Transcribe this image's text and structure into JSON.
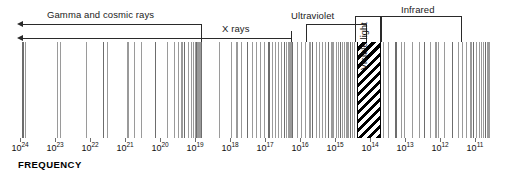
{
  "figure": {
    "axis_title": "FREQUENCY",
    "background_color": "#ffffff",
    "line_color": "#8e8e8e",
    "ink_color": "#2a2a2a"
  },
  "bands": {
    "gamma": {
      "label": "Gamma and cosmic rays",
      "marker": "arrow-left"
    },
    "xrays": {
      "label": "X rays",
      "marker": "arrow-left"
    },
    "ultraviolet": {
      "label": "Ultraviolet",
      "marker": "bracket"
    },
    "visible": {
      "label": "Visible light",
      "marker": "bracket",
      "orientation": "vertical",
      "fill": "diagonal-hatch"
    },
    "infrared": {
      "label": "Infrared",
      "marker": "bracket"
    }
  },
  "axis": {
    "label": "FREQUENCY",
    "unit_base": "10",
    "ticks": [
      {
        "base": "10",
        "exponent": "24"
      },
      {
        "base": "10",
        "exponent": "23"
      },
      {
        "base": "10",
        "exponent": "22"
      },
      {
        "base": "10",
        "exponent": "21"
      },
      {
        "base": "10",
        "exponent": "20"
      },
      {
        "base": "10",
        "exponent": "19"
      },
      {
        "base": "10",
        "exponent": "18"
      },
      {
        "base": "10",
        "exponent": "17"
      },
      {
        "base": "10",
        "exponent": "16"
      },
      {
        "base": "10",
        "exponent": "15"
      },
      {
        "base": "10",
        "exponent": "14"
      },
      {
        "base": "10",
        "exponent": "13"
      },
      {
        "base": "10",
        "exponent": "12"
      },
      {
        "base": "10",
        "exponent": "11"
      }
    ]
  },
  "chart_data": {
    "type": "line",
    "xlabel": "FREQUENCY",
    "ylabel": "",
    "x_scale": "log10-descending",
    "x_tick_exponents": [
      24,
      23,
      22,
      21,
      20,
      19,
      18,
      17,
      16,
      15,
      14,
      13,
      12,
      11
    ],
    "x_tick_labels": [
      "10^24",
      "10^23",
      "10^22",
      "10^21",
      "10^20",
      "10^19",
      "10^18",
      "10^17",
      "10^16",
      "10^15",
      "10^14",
      "10^13",
      "10^12",
      "10^11"
    ],
    "x_pixel_positions": [
      20,
      55,
      90,
      125,
      160,
      195,
      230,
      265,
      300,
      335,
      370,
      405,
      440,
      475
    ],
    "grid": false,
    "legend": false,
    "annotations": [
      {
        "text": "Gamma and cosmic rays",
        "type": "arrow-left",
        "x_start_px": 22,
        "x_end_px": 202,
        "y_px": 24
      },
      {
        "text": "X rays",
        "type": "arrow-left",
        "x_start_px": 22,
        "x_end_px": 292,
        "y_px": 38
      },
      {
        "text": "Ultraviolet",
        "type": "bracket",
        "x_start_px": 306,
        "x_end_px": 367,
        "y_px": 24
      },
      {
        "text": "Visible light",
        "type": "bracket-vertical",
        "x_start_px": 355,
        "x_end_px": 380,
        "y_px": 22
      },
      {
        "text": "Infrared",
        "type": "bracket",
        "x_start_px": 381,
        "x_end_px": 462,
        "y_px": 14
      }
    ],
    "visible_band": {
      "x_start_px": 357,
      "x_end_px": 381,
      "exponent_range": [
        15,
        14
      ]
    },
    "series": [
      {
        "name": "emission lines",
        "description": "vertical spectral emission lines across the frequency axis",
        "x_pixel_positions": [
          22,
          25,
          57,
          60,
          86,
          103,
          107,
          127,
          134,
          141,
          155,
          167,
          174,
          178,
          181,
          184,
          188,
          191,
          193,
          195,
          196,
          197,
          198,
          199,
          200,
          201,
          219,
          231,
          236,
          241,
          247,
          252,
          256,
          260,
          264,
          268,
          272,
          275,
          278,
          281,
          284,
          286,
          288,
          290,
          291,
          292,
          297,
          301,
          305,
          309,
          312,
          316,
          319,
          322,
          325,
          328,
          331,
          333,
          336,
          338,
          340,
          342,
          344,
          346,
          348,
          350,
          352,
          354,
          383,
          388,
          395,
          401,
          404,
          412,
          419,
          424,
          430,
          435,
          438,
          444,
          452,
          458,
          462,
          466,
          470,
          473,
          476,
          479,
          481,
          483,
          485,
          487,
          489
        ]
      }
    ]
  }
}
